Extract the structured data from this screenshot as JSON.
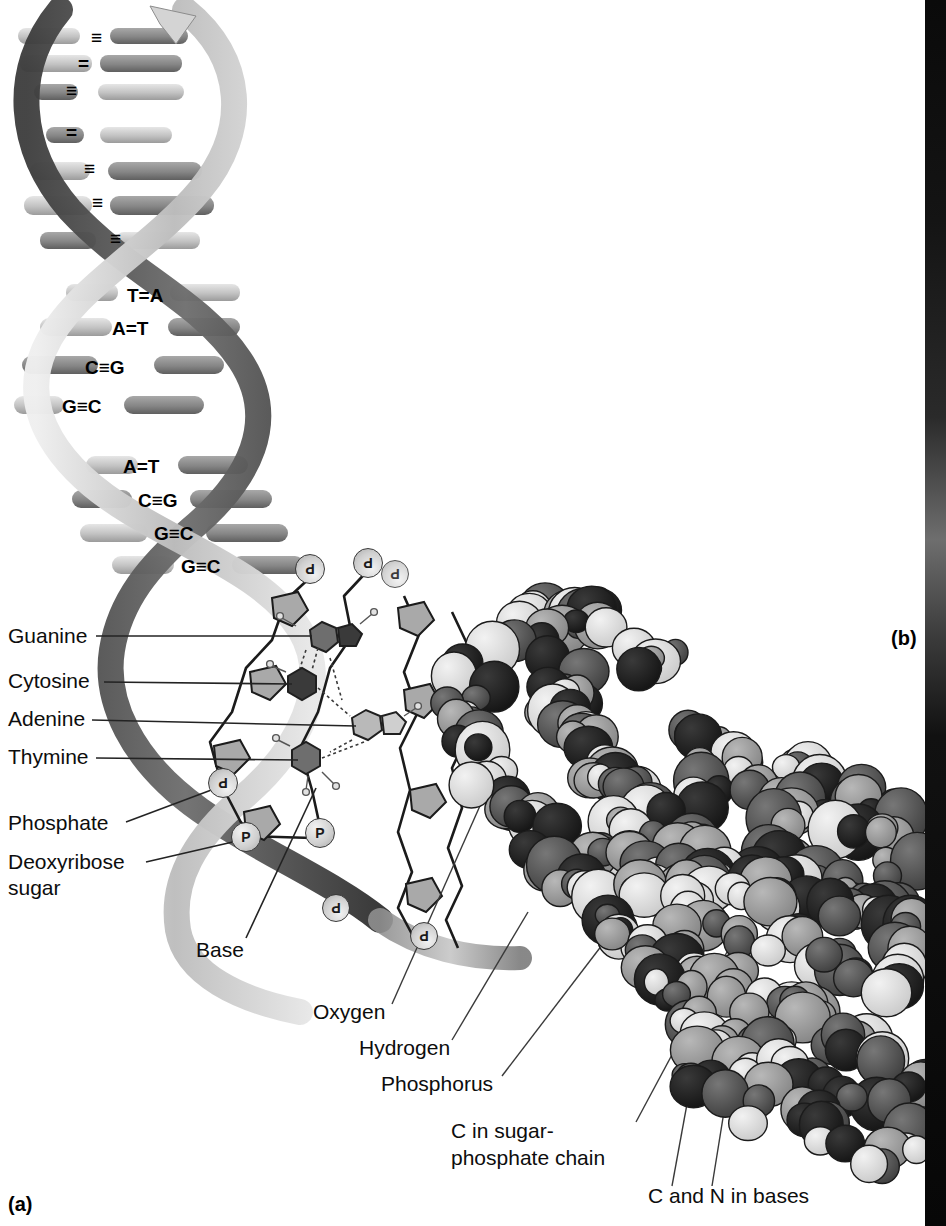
{
  "figure": {
    "panel_a_tag": "(a)",
    "panel_b_tag": "(b)"
  },
  "helix": {
    "base_pairs": [
      {
        "id": "bp1",
        "text": "≡",
        "letters": "",
        "bond": "triple"
      },
      {
        "id": "bp2",
        "text": "=",
        "letters": "",
        "bond": "double"
      },
      {
        "id": "bp3",
        "text": "≡",
        "letters": "",
        "bond": "triple"
      },
      {
        "id": "bp4",
        "text": "=",
        "letters": "",
        "bond": "double"
      },
      {
        "id": "bp5",
        "text": "≡",
        "letters": "",
        "bond": "triple"
      },
      {
        "id": "bp6",
        "text": "≡",
        "letters": "",
        "bond": "triple"
      },
      {
        "id": "bp7",
        "text": "≡",
        "letters": "",
        "bond": "triple"
      },
      {
        "id": "bp8",
        "text": "T=A",
        "letters": "TA",
        "bond": "double"
      },
      {
        "id": "bp9",
        "text": "A=T",
        "letters": "AT",
        "bond": "double"
      },
      {
        "id": "bp10",
        "text": "C≡G",
        "letters": "CG",
        "bond": "triple"
      },
      {
        "id": "bp11",
        "text": "G≡C",
        "letters": "GC",
        "bond": "triple"
      },
      {
        "id": "bp12",
        "text": "A=T",
        "letters": "AT",
        "bond": "double"
      },
      {
        "id": "bp13",
        "text": "C≡G",
        "letters": "CG",
        "bond": "triple"
      },
      {
        "id": "bp14",
        "text": "G≡C",
        "letters": "GC",
        "bond": "triple"
      },
      {
        "id": "bp15",
        "text": "G≡C",
        "letters": "GC",
        "bond": "triple"
      }
    ],
    "phosphate_glyph": "P"
  },
  "labels_left": [
    {
      "id": "guanine",
      "text": "Guanine"
    },
    {
      "id": "cytosine",
      "text": "Cytosine"
    },
    {
      "id": "adenine",
      "text": "Adenine"
    },
    {
      "id": "thymine",
      "text": "Thymine"
    },
    {
      "id": "phosphate",
      "text": "Phosphate"
    },
    {
      "id": "deoxyribose",
      "text": "Deoxyribose"
    },
    {
      "id": "sugar",
      "text": "sugar"
    },
    {
      "id": "base",
      "text": "Base"
    }
  ],
  "labels_right": [
    {
      "id": "oxygen",
      "text": "Oxygen"
    },
    {
      "id": "hydrogen",
      "text": "Hydrogen"
    },
    {
      "id": "phosphorus",
      "text": "Phosphorus"
    },
    {
      "id": "c-sugar-1",
      "text": "C in sugar-"
    },
    {
      "id": "c-sugar-2",
      "text": "phosphate chain"
    },
    {
      "id": "c-n-bases",
      "text": "C and N in bases"
    }
  ],
  "colors": {
    "background": "#ffffff",
    "text": "#0d0d0d",
    "leader_line": "#262626",
    "ribbon_dark": "#4e4e4e",
    "ribbon_mid": "#8e8e8e",
    "ribbon_light": "#d2d2d2",
    "rung_light": "#cfcfcf",
    "rung_mid": "#9d9d9d",
    "rung_dark": "#6a6a6a",
    "atom_dark": "#4a4a4a",
    "atom_mid": "#8c8c8c",
    "atom_light": "#d8d8d8",
    "atom_white": "#f0f0f0",
    "atom_black": "#222222",
    "edge_strip": "#0d0d0d"
  }
}
